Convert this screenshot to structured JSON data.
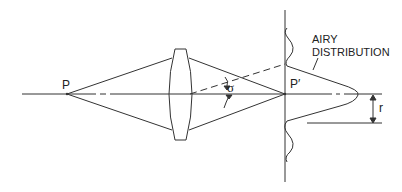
{
  "diagram": {
    "type": "optics-ray-diagram",
    "labels": {
      "object_point": "P",
      "image_point": "P′",
      "angle": "σ",
      "distribution_line1": "AIRY",
      "distribution_line2": "DISTRIBUTION",
      "radius": "r"
    },
    "elements": [
      "optical-axis",
      "biconvex-lens",
      "image-plane",
      "marginal-rays",
      "chief-ray-dashed",
      "airy-pattern-curve",
      "radius-dimension-arrow"
    ],
    "colors": {
      "line": "#333333",
      "background": "#ffffff"
    }
  }
}
